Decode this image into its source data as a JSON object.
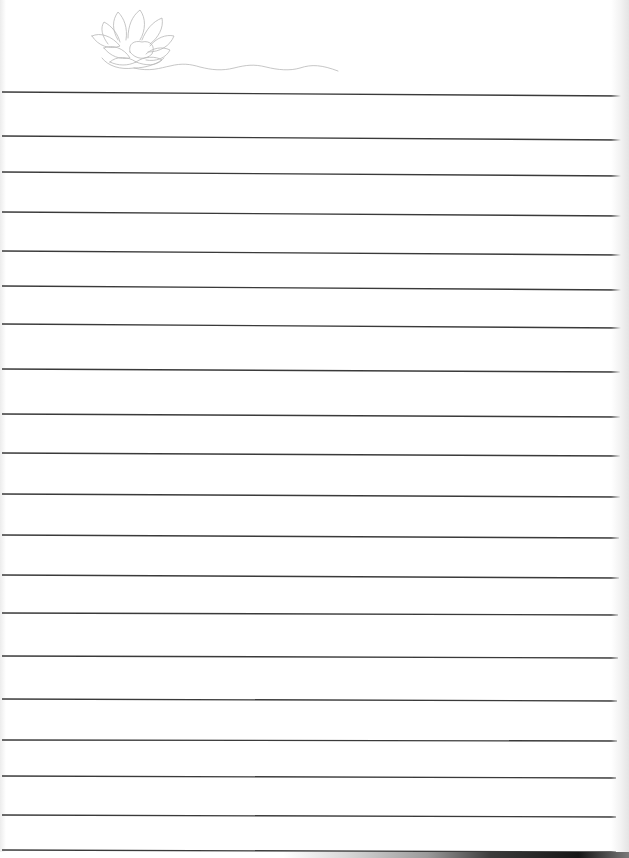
{
  "document": {
    "type": "lined-notepaper",
    "background_color": "#ffffff",
    "line_color": "#3a3a3a",
    "decoration": {
      "icon": "lotus-flower-icon",
      "stroke_color": "#b8b8b8",
      "position": "top-left"
    },
    "ruled_lines": [
      {
        "y_left": 92,
        "y_right": 96
      },
      {
        "y_left": 136,
        "y_right": 140
      },
      {
        "y_left": 172,
        "y_right": 176
      },
      {
        "y_left": 212,
        "y_right": 216
      },
      {
        "y_left": 251,
        "y_right": 255
      },
      {
        "y_left": 286,
        "y_right": 290
      },
      {
        "y_left": 324,
        "y_right": 328
      },
      {
        "y_left": 369,
        "y_right": 372
      },
      {
        "y_left": 414,
        "y_right": 417
      },
      {
        "y_left": 453,
        "y_right": 456
      },
      {
        "y_left": 494,
        "y_right": 497
      },
      {
        "y_left": 535,
        "y_right": 538
      },
      {
        "y_left": 575,
        "y_right": 578
      },
      {
        "y_left": 613,
        "y_right": 615
      },
      {
        "y_left": 656,
        "y_right": 658
      },
      {
        "y_left": 699,
        "y_right": 701
      },
      {
        "y_left": 740,
        "y_right": 741
      },
      {
        "y_left": 776,
        "y_right": 778
      },
      {
        "y_left": 815,
        "y_right": 817
      },
      {
        "y_left": 850,
        "y_right": 852
      }
    ]
  }
}
